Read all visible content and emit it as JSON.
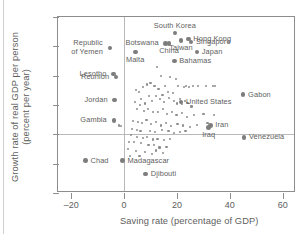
{
  "chart_data": {
    "type": "scatter",
    "title": "",
    "xlabel": "Saving rate (percentage of GDP)",
    "ylabel": "Growth rate of real GDP per person\n(percent per year)",
    "xlim": [
      -25,
      65
    ],
    "ylim": [
      -4,
      8
    ],
    "xticks": [
      -20,
      0,
      20,
      40,
      60
    ],
    "xtick_labels": [
      "–20",
      "0",
      "20",
      "40",
      "60"
    ],
    "yticks": [
      -4,
      -2,
      0,
      2,
      4,
      6,
      8
    ],
    "ytick_labels": [
      "–4",
      "–2",
      "0",
      "2",
      "4",
      "6",
      "8"
    ],
    "grid": false,
    "legend": null,
    "zero_lines": {
      "horizontal_at_y": 0,
      "vertical_at_x": 0
    },
    "labeled_points": [
      {
        "name": "Republic of Yemen",
        "x": -5.4,
        "y": 5.9,
        "label_pos": "left",
        "label_text": "Republic\nof Yemen"
      },
      {
        "name": "South Korea",
        "x": 19.2,
        "y": 6.9,
        "label_pos": "above",
        "label_text": "South Korea"
      },
      {
        "name": "Hong Kong",
        "x": 24.3,
        "y": 6.5,
        "label_pos": "right",
        "label_text": "Hong Kong"
      },
      {
        "name": "Singapore",
        "x": 25.3,
        "y": 6.3,
        "label_pos": "right",
        "label_text": "Singapore"
      },
      {
        "name": "Botswana",
        "x": 15.7,
        "y": 6.2,
        "label_pos": "left",
        "label_text": "Botswana"
      },
      {
        "name": "China",
        "x": 17.0,
        "y": 6.2,
        "label_pos": "below",
        "label_text": "China"
      },
      {
        "name": "Taiwan",
        "x": 21.5,
        "y": 6.4,
        "label_pos": "below",
        "label_text": "Taiwan"
      },
      {
        "name": "Japan",
        "x": 27.5,
        "y": 5.6,
        "label_pos": "right",
        "label_text": "Japan"
      },
      {
        "name": "Malta",
        "x": 4.2,
        "y": 5.6,
        "label_pos": "below",
        "label_text": "Malta"
      },
      {
        "name": "Bahamas",
        "x": 19.0,
        "y": 5.0,
        "label_pos": "right",
        "label_text": "Bahamas"
      },
      {
        "name": "Lesotho",
        "x": -4.0,
        "y": 4.1,
        "label_pos": "left",
        "label_text": "Lesotho"
      },
      {
        "name": "Reunion",
        "x": -3.0,
        "y": 3.9,
        "label_pos": "left",
        "label_text": "Reunion"
      },
      {
        "name": "Gabon",
        "x": 45.0,
        "y": 2.7,
        "label_pos": "right",
        "label_text": "Gabon"
      },
      {
        "name": "Jordan",
        "x": -3.6,
        "y": 2.35,
        "label_pos": "left",
        "label_text": "Jordan"
      },
      {
        "name": "United States",
        "x": 21.5,
        "y": 2.2,
        "label_pos": "right",
        "label_text": "United States"
      },
      {
        "name": "Gambia",
        "x": -3.9,
        "y": 0.95,
        "label_pos": "left",
        "label_text": "Gambia"
      },
      {
        "name": "Iran",
        "x": 32.6,
        "y": 0.6,
        "label_pos": "right",
        "label_text": "Iran"
      },
      {
        "name": "Iraq",
        "x": 32.0,
        "y": 0.45,
        "label_pos": "below",
        "label_text": "Iraq"
      },
      {
        "name": "Venezuela",
        "x": 45.3,
        "y": -0.2,
        "label_pos": "right",
        "label_text": "Venezuela"
      },
      {
        "name": "Chad",
        "x": -14.6,
        "y": -1.8,
        "label_pos": "right",
        "label_text": "Chad"
      },
      {
        "name": "Madagascar",
        "x": -0.6,
        "y": -1.8,
        "label_pos": "right",
        "label_text": "Madagascar"
      },
      {
        "name": "Djibouti",
        "x": 8.2,
        "y": -2.7,
        "label_pos": "right",
        "label_text": "Djibouti"
      }
    ],
    "unlabeled_points": [
      [
        12.5,
        4.6
      ],
      [
        14.0,
        4.0
      ],
      [
        17.5,
        3.9
      ],
      [
        19.5,
        3.8
      ],
      [
        10.0,
        3.5
      ],
      [
        11.5,
        3.3
      ],
      [
        7.0,
        3.2
      ],
      [
        4.5,
        3.0
      ],
      [
        5.6,
        2.9
      ],
      [
        8.8,
        3.4
      ],
      [
        13.0,
        3.1
      ],
      [
        15.5,
        3.3
      ],
      [
        20.5,
        3.3
      ],
      [
        22.5,
        3.25
      ],
      [
        23.5,
        3.3
      ],
      [
        24.5,
        3.2
      ],
      [
        26.0,
        3.3
      ],
      [
        28.0,
        3.3
      ],
      [
        31.0,
        3.3
      ],
      [
        33.5,
        3.3
      ],
      [
        34.5,
        3.3
      ],
      [
        16.5,
        2.9
      ],
      [
        18.5,
        2.8
      ],
      [
        14.5,
        2.7
      ],
      [
        12.0,
        2.6
      ],
      [
        9.5,
        2.6
      ],
      [
        6.5,
        2.4
      ],
      [
        4.0,
        2.2
      ],
      [
        6.0,
        2.0
      ],
      [
        8.0,
        2.1
      ],
      [
        10.5,
        2.3
      ],
      [
        13.5,
        2.4
      ],
      [
        15.0,
        2.2
      ],
      [
        17.0,
        2.45
      ],
      [
        19.0,
        2.3
      ],
      [
        20.0,
        2.1
      ],
      [
        21.0,
        2.4
      ],
      [
        22.0,
        2.05
      ],
      [
        23.0,
        2.3
      ],
      [
        24.0,
        2.15
      ],
      [
        25.5,
        1.9
      ],
      [
        5.0,
        1.7
      ],
      [
        7.5,
        1.6
      ],
      [
        9.0,
        1.75
      ],
      [
        11.0,
        1.5
      ],
      [
        12.8,
        1.55
      ],
      [
        14.8,
        1.7
      ],
      [
        16.2,
        1.4
      ],
      [
        18.0,
        1.5
      ],
      [
        19.8,
        1.3
      ],
      [
        21.8,
        1.45
      ],
      [
        23.8,
        1.2
      ],
      [
        26.5,
        1.3
      ],
      [
        30.0,
        1.4
      ],
      [
        34.0,
        1.3
      ],
      [
        3.4,
        0.9
      ],
      [
        5.2,
        0.85
      ],
      [
        6.8,
        0.8
      ],
      [
        8.5,
        0.95
      ],
      [
        10.2,
        0.7
      ],
      [
        12.2,
        0.85
      ],
      [
        13.8,
        0.6
      ],
      [
        15.8,
        0.8
      ],
      [
        17.8,
        0.55
      ],
      [
        20.2,
        0.7
      ],
      [
        22.4,
        0.6
      ],
      [
        24.8,
        0.5
      ],
      [
        27.5,
        0.65
      ],
      [
        31.5,
        0.8
      ],
      [
        -2.0,
        0.6
      ],
      [
        -1.2,
        0.55
      ],
      [
        3.0,
        0.35
      ],
      [
        4.8,
        0.3
      ],
      [
        6.2,
        0.2
      ],
      [
        9.8,
        0.25
      ],
      [
        11.8,
        0.15
      ],
      [
        14.2,
        0.3
      ],
      [
        16.8,
        0.2
      ],
      [
        18.8,
        0.1
      ],
      [
        21.2,
        0.15
      ],
      [
        23.2,
        0.25
      ],
      [
        2.6,
        -0.05
      ],
      [
        5.0,
        -0.2
      ],
      [
        7.2,
        -0.25
      ],
      [
        8.6,
        -0.2
      ],
      [
        10.8,
        -0.35
      ],
      [
        12.6,
        -0.3
      ],
      [
        15.2,
        -0.4
      ],
      [
        17.2,
        -0.3
      ],
      [
        1.8,
        -0.55
      ],
      [
        3.6,
        -0.5
      ],
      [
        6.4,
        -0.6
      ],
      [
        9.2,
        -0.75
      ],
      [
        11.4,
        -0.7
      ],
      [
        13.4,
        -0.9
      ],
      [
        16.0,
        -0.85
      ],
      [
        1.4,
        -1.0
      ],
      [
        4.4,
        -1.15
      ],
      [
        7.8,
        -1.2
      ],
      [
        10.6,
        -1.35
      ],
      [
        5.8,
        -1.5
      ],
      [
        2.2,
        -1.45
      ],
      [
        12.0,
        -1.1
      ],
      [
        14.6,
        -1.25
      ]
    ]
  }
}
